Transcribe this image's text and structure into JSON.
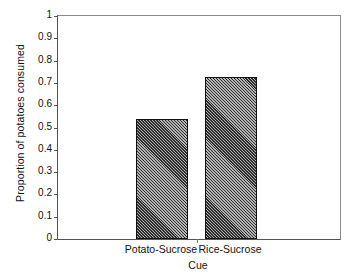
{
  "chart_data": {
    "type": "bar",
    "title": "",
    "subtitle": "",
    "xlabel": "Cue",
    "ylabel": "Proportion of potatoes consumed",
    "categories": [
      "Potato-Sucrose",
      "Rice-Sucrose"
    ],
    "values": [
      0.54,
      0.725
    ],
    "ylim": [
      0,
      1
    ],
    "xlim": [
      0,
      1
    ],
    "ytick_labels": [
      "0",
      "0.1",
      "0.2",
      "0.3",
      "0.4",
      "0.5",
      "0.6",
      "0.7",
      "0.8",
      "0.9",
      "1"
    ],
    "ytick_values": [
      0,
      0.1,
      0.2,
      0.3,
      0.4,
      0.5,
      0.6,
      0.7,
      0.8,
      0.9,
      1
    ],
    "grid": false,
    "legend": null,
    "legend_position": "none",
    "annotations": [],
    "bar_style": {
      "fill": "diagonal-hatch",
      "hatch_color": "#2c2c2c",
      "background_color": "#b4b4b4",
      "edge_color": "#111111"
    },
    "axis_color": "#555555",
    "frame_color": "#8a8a8a",
    "text_color": "#111111",
    "background_color": "#ffffff"
  }
}
